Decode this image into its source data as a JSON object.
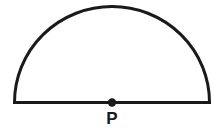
{
  "diagram": {
    "shape": "semicircle",
    "stroke_color": "#1a1a1a",
    "fill_color": "#ffffff",
    "center": {
      "x": 112,
      "y": 102
    },
    "radius": 97,
    "point": {
      "label": "P",
      "position": "center of diameter",
      "dot_radius": 4
    }
  }
}
